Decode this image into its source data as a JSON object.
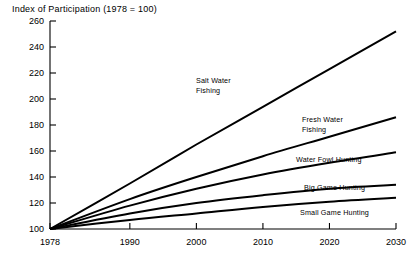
{
  "chart_data": {
    "type": "line",
    "title": "Index of Participation (1978 = 100)",
    "xlabel": "",
    "ylabel": "",
    "xlim": [
      1978,
      2030
    ],
    "ylim": [
      100,
      260
    ],
    "grid": false,
    "legend": "inline-labels",
    "x_ticks": [
      "1978",
      "1990",
      "2000",
      "2010",
      "2020",
      "2030"
    ],
    "x_tick_values": [
      1978,
      1990,
      2000,
      2010,
      2020,
      2030
    ],
    "y_ticks": [
      "100",
      "120",
      "140",
      "160",
      "180",
      "200",
      "220",
      "240",
      "260"
    ],
    "y_tick_values": [
      100,
      120,
      140,
      160,
      180,
      200,
      220,
      240,
      260
    ],
    "x": [
      1978,
      1990,
      2000,
      2010,
      2020,
      2030
    ],
    "series": [
      {
        "name": "Salt Water Fishing",
        "label": "Salt Water Fishing",
        "label_line1": "Salt Water",
        "label_line2": "Fishing",
        "values": [
          100,
          135,
          165,
          194,
          223,
          252
        ]
      },
      {
        "name": "Fresh Water Fishing",
        "label": "Fresh Water Fishing",
        "label_line1": "Fresh Water",
        "label_line2": "Fishing",
        "values": [
          100,
          123,
          140,
          156,
          171,
          186
        ]
      },
      {
        "name": "Water Fowl Hunting",
        "label": "Water Fowl Hunting",
        "label_line1": "Water Fowl Hunting",
        "label_line2": "",
        "values": [
          100,
          118,
          131,
          142,
          151,
          159
        ]
      },
      {
        "name": "Big Game Hunting",
        "label": "Big Game Hunting",
        "label_line1": "Big Game Hunting",
        "label_line2": "",
        "values": [
          100,
          112,
          120,
          126,
          131,
          134
        ]
      },
      {
        "name": "Small Game Hunting",
        "label": "Small Game Hunting",
        "label_line1": "Small Game Hunting",
        "label_line2": "",
        "values": [
          100,
          107,
          112,
          117,
          121,
          124
        ]
      }
    ],
    "colors": {
      "line": "#000000",
      "axis": "#000000",
      "background": "#ffffff"
    }
  }
}
